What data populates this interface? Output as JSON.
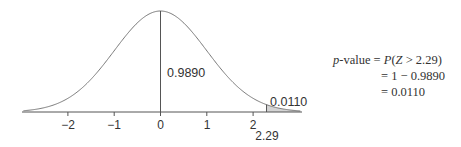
{
  "chart_data": {
    "type": "area",
    "title": "",
    "xlabel": "",
    "ylabel": "",
    "xlim": [
      -2.96,
      3.02
    ],
    "x_ticks": [
      "−2",
      "−1",
      "0",
      "1",
      "2"
    ],
    "x_tick_values": [
      -2,
      -1,
      0,
      1,
      2
    ],
    "series": [
      {
        "name": "standard normal density",
        "function": "N(0,1) pdf"
      }
    ],
    "shaded_region": {
      "from": 2.29,
      "to": 3.02,
      "area": 0.011
    },
    "vertical_line_at": 0,
    "annotations": [
      {
        "text": "0.9890",
        "meaning": "area left of 2.29"
      },
      {
        "text": "0.0110",
        "meaning": "area right of 2.29"
      },
      {
        "text": "2.29",
        "meaning": "cutoff z value"
      }
    ],
    "grid": false,
    "legend": null
  },
  "labels": {
    "left_area": "0.9890",
    "right_area": "0.0110",
    "cutoff": "2.29",
    "ticks": [
      "−2",
      "−1",
      "0",
      "1",
      "2"
    ]
  },
  "formula": {
    "line1_lhs_italic": "p",
    "line1_lhs_rest": "-value",
    "eq": "=",
    "line1_rhs_P": "P",
    "line1_rhs_open": "(",
    "line1_rhs_Z": "Z",
    "line1_rhs_rest": " > 2.29)",
    "line2_rhs": "1 − 0.9890",
    "line3_rhs": "0.0110"
  },
  "colors": {
    "curve": "#777777",
    "axis": "#555555",
    "shade": "#d4d4d4",
    "text": "#333333"
  }
}
